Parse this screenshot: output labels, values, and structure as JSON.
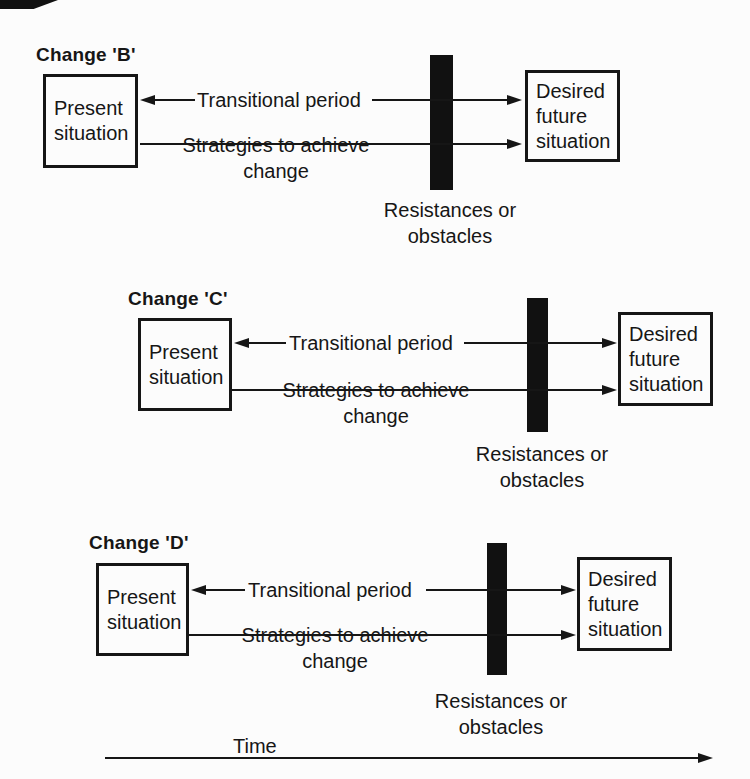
{
  "colors": {
    "ink": "#161616",
    "background": "#fcfcfc",
    "bar": "#111111"
  },
  "sections": [
    {
      "title": "Change 'B'",
      "present": "Present\nsituation",
      "desired": "Desired\nfuture\nsituation",
      "transitional": "Transitional period",
      "strategies": "Strategies to achieve\nchange",
      "resistances": "Resistances or\nobstacles"
    },
    {
      "title": "Change 'C'",
      "present": "Present\nsituation",
      "desired": "Desired\nfuture\nsituation",
      "transitional": "Transitional period",
      "strategies": "Strategies to achieve\nchange",
      "resistances": "Resistances or\nobstacles"
    },
    {
      "title": "Change 'D'",
      "present": "Present\nsituation",
      "desired": "Desired\nfuture\nsituation",
      "transitional": "Transitional period",
      "strategies": "Strategies to achieve\nchange",
      "resistances": "Resistances or\nobstacles"
    }
  ],
  "timeline": {
    "label": "Time"
  }
}
